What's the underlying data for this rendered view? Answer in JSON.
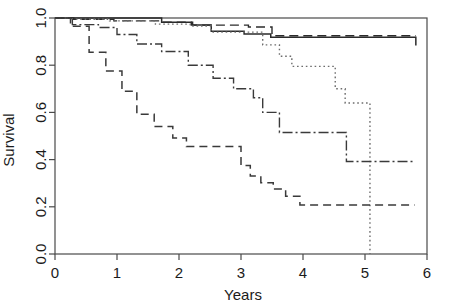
{
  "chart_data": {
    "type": "line",
    "title": "",
    "subtitle": "",
    "xlabel": "Years",
    "ylabel": "Survival",
    "xlim": [
      0,
      6
    ],
    "ylim": [
      0,
      1.0
    ],
    "xticks": [
      0,
      1,
      2,
      3,
      4,
      5,
      6
    ],
    "xticklabels": [
      "0",
      "1",
      "2",
      "3",
      "4",
      "5",
      "6"
    ],
    "yticks": [
      0.0,
      0.2,
      0.4,
      0.6,
      0.8,
      1.0
    ],
    "yticklabels": [
      "0.0",
      "0.2",
      "0.4",
      "0.6",
      "0.8",
      "1.0"
    ],
    "grid": false,
    "legend": "none",
    "step_type": "post",
    "series": [
      {
        "name": "curve-solid",
        "style": "solid",
        "color": "#2b2b2b",
        "dasharray": "none",
        "width": 1.5,
        "x": [
          0.0,
          0.95,
          1.72,
          2.2,
          2.52,
          3.05,
          3.48,
          5.82
        ],
        "y": [
          1.0,
          1.0,
          0.982,
          0.97,
          0.944,
          0.932,
          0.918,
          0.884
        ]
      },
      {
        "name": "curve-dashed-top",
        "style": "dashed",
        "color": "#2b2b2b",
        "dasharray": "9,5",
        "width": 1.4,
        "x": [
          0.0,
          0.3,
          0.95,
          1.72,
          2.22,
          3.12,
          3.5,
          5.82
        ],
        "y": [
          1.0,
          0.994,
          0.988,
          0.982,
          0.97,
          0.962,
          0.925,
          0.925
        ]
      },
      {
        "name": "curve-dotted",
        "style": "dotted",
        "color": "#6d6d6d",
        "dasharray": "1.6,2.8",
        "width": 1.4,
        "x": [
          0.0,
          0.28,
          0.88,
          1.62,
          2.18,
          2.52,
          3.35,
          3.62,
          3.82,
          4.52,
          4.68,
          5.08,
          5.08
        ],
        "y": [
          1.0,
          0.995,
          0.988,
          0.974,
          0.966,
          0.94,
          0.886,
          0.838,
          0.795,
          0.7,
          0.64,
          0.572,
          0.0
        ]
      },
      {
        "name": "curve-dashdot",
        "style": "dashdot",
        "color": "#3a3a3a",
        "dasharray": "10,3,2,3",
        "width": 1.4,
        "x": [
          0.0,
          0.28,
          0.7,
          1.0,
          1.32,
          1.72,
          2.15,
          2.55,
          2.88,
          3.2,
          3.35,
          3.62,
          4.52,
          4.7,
          5.78
        ],
        "y": [
          1.0,
          0.972,
          0.96,
          0.93,
          0.89,
          0.858,
          0.8,
          0.745,
          0.7,
          0.662,
          0.6,
          0.515,
          0.515,
          0.392,
          0.392
        ]
      },
      {
        "name": "curve-dashed-bottom",
        "style": "dashed",
        "color": "#3a3a3a",
        "dasharray": "8,5",
        "width": 1.5,
        "x": [
          0.0,
          0.25,
          0.55,
          0.82,
          1.08,
          1.32,
          1.6,
          1.9,
          2.12,
          2.82,
          3.0,
          3.15,
          3.32,
          3.52,
          3.72,
          3.95,
          5.8
        ],
        "y": [
          1.0,
          0.965,
          0.855,
          0.775,
          0.69,
          0.592,
          0.54,
          0.492,
          0.455,
          0.455,
          0.375,
          0.33,
          0.302,
          0.275,
          0.245,
          0.208,
          0.208
        ]
      }
    ]
  },
  "axes": {
    "y_label": "Survival",
    "x_label": "Years"
  },
  "ticks": {
    "x": [
      "0",
      "1",
      "2",
      "3",
      "4",
      "5",
      "6"
    ],
    "y": [
      "0.0",
      "0.2",
      "0.4",
      "0.6",
      "0.8",
      "1.0"
    ]
  },
  "colors": {
    "frame": "#4a4a4a",
    "text": "#1b1b1b",
    "background": "#ffffff"
  }
}
